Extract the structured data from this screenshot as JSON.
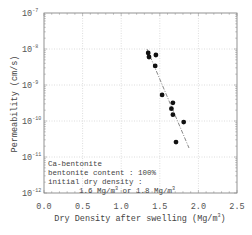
{
  "chart_data": {
    "type": "scatter",
    "title": "",
    "xlabel": "Dry Density after swelling (Mg/m³)",
    "ylabel": "Permeability (cm/s)",
    "xlim": [
      0.0,
      2.5
    ],
    "ylim": [
      1e-12,
      1e-07
    ],
    "yscale": "log",
    "grid": true,
    "x_ticks": [
      "0.0",
      "0.5",
      "1.0",
      "1.5",
      "2.0",
      "2.5"
    ],
    "y_ticks": [
      "10-7",
      "10-8",
      "10-9",
      "10-10",
      "10-11",
      "10-12"
    ],
    "series": [
      {
        "name": "measured",
        "marker": "filled-circle",
        "points": [
          {
            "x": 1.35,
            "y": 7.8e-09
          },
          {
            "x": 1.36,
            "y": 6e-09
          },
          {
            "x": 1.45,
            "y": 6.8e-09
          },
          {
            "x": 1.44,
            "y": 3.4e-09
          },
          {
            "x": 1.53,
            "y": 5.3e-10
          },
          {
            "x": 1.67,
            "y": 3.2e-10
          },
          {
            "x": 1.65,
            "y": 2.2e-10
          },
          {
            "x": 1.67,
            "y": 1.5e-10
          },
          {
            "x": 1.81,
            "y": 9.3e-11
          },
          {
            "x": 1.71,
            "y": 2.6e-11
          }
        ]
      },
      {
        "name": "trend",
        "style": "dash-dot",
        "points": [
          {
            "x": 1.33,
            "y": 1e-08
          },
          {
            "x": 1.88,
            "y": 1.8e-11
          }
        ]
      }
    ],
    "annotation": [
      "Ca-bentonite",
      "bentonite content : 100%",
      "initial dry density :",
      "1.6 Mg/m³ or 1.8 Mg/m³"
    ]
  },
  "labels": {
    "xlabel": "Dry Density after swelling (Mg/m",
    "xlabel_sup": "3",
    "xlabel_end": ")",
    "ylabel": "Permeability (cm/s)",
    "x_ticks": [
      "0.0",
      "0.5",
      "1.0",
      "1.5",
      "2.0",
      "2.5"
    ],
    "y_exps": [
      "-7",
      "-8",
      "-9",
      "-10",
      "-11",
      "-12"
    ],
    "note_line1": "Ca-bentonite",
    "note_line2": "bentonite content : 100%",
    "note_line3": "initial dry density :",
    "note_line4a": "1.6 Mg/m",
    "note_line4b": " or 1.8 Mg/m",
    "sup3": "3"
  }
}
